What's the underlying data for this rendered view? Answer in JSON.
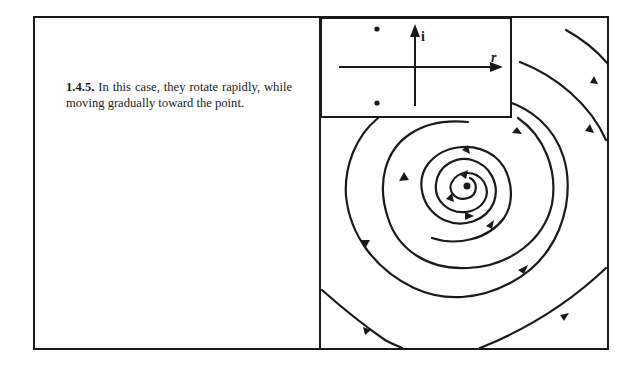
{
  "caption": {
    "number": "1.4.5.",
    "text": "In this case, they rotate rapidly, while moving gradually toward the point."
  },
  "inset": {
    "axis_real_label": "r",
    "axis_imag_label": "i",
    "eigenvalue_points": [
      "upper-left complex eigenvalue dot",
      "lower-left complex eigenvalue dot"
    ]
  },
  "figure": {
    "type": "phase portrait"
  },
  "colors": {
    "ink": "#1a1a1a",
    "paper": "#ffffff"
  }
}
